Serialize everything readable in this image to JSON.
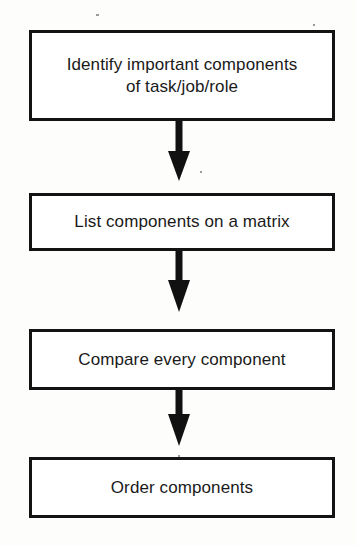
{
  "diagram": {
    "type": "flowchart",
    "orientation": "vertical",
    "background_color": "#fdfdfc",
    "border_color": "#131313",
    "text_color": "#1a1a1a",
    "arrow_color": "#111111",
    "nodes": [
      {
        "id": "identify-components",
        "label": "Identify important components\nof task/job/role",
        "shape": "rectangle",
        "lines": 2
      },
      {
        "id": "list-components",
        "label": "List components on a matrix",
        "shape": "rectangle",
        "lines": 1
      },
      {
        "id": "compare-components",
        "label": "Compare every component",
        "shape": "rectangle",
        "lines": 1
      },
      {
        "id": "order-components",
        "label": "Order components",
        "shape": "rectangle",
        "lines": 1
      }
    ],
    "edges": [
      {
        "id": "edge-1",
        "from": "identify-components",
        "to": "list-components",
        "style": "solid-arrow",
        "direction": "down"
      },
      {
        "id": "edge-2",
        "from": "list-components",
        "to": "compare-components",
        "style": "solid-arrow",
        "direction": "down"
      },
      {
        "id": "edge-3",
        "from": "compare-components",
        "to": "order-components",
        "style": "solid-arrow",
        "direction": "down"
      }
    ]
  }
}
